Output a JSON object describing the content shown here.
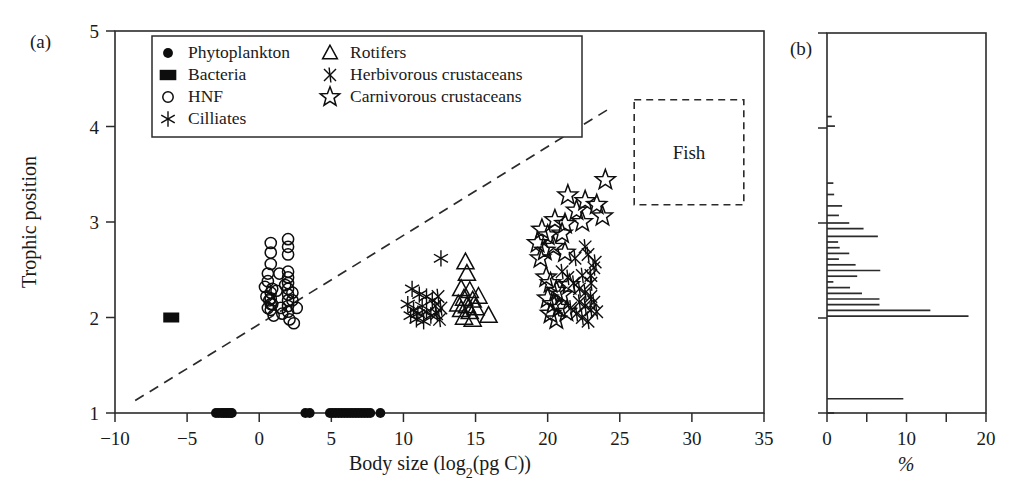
{
  "figure": {
    "panels": [
      {
        "id": "a",
        "label": "(a)"
      },
      {
        "id": "b",
        "label": "(b)"
      }
    ]
  },
  "legend": {
    "entries": [
      {
        "label": "Phytoplankton",
        "marker": "filled-circle-icon",
        "column": 0
      },
      {
        "label": "Bacteria",
        "marker": "filled-square-icon",
        "column": 0
      },
      {
        "label": "HNF",
        "marker": "open-circle-icon",
        "column": 0
      },
      {
        "label": "Cilliates",
        "marker": "asterisk-icon",
        "column": 0
      },
      {
        "label": "Rotifers",
        "marker": "open-triangle-icon",
        "column": 1
      },
      {
        "label": "Herbivorous crustaceans",
        "marker": "cross-x-icon",
        "column": 1
      },
      {
        "label": "Carnivorous crustaceans",
        "marker": "open-star-icon",
        "column": 1
      }
    ]
  },
  "annotations": {
    "fish_box_label": "Fish"
  },
  "chart_data": [
    {
      "panel": "a",
      "type": "scatter",
      "title": "",
      "xlabel": "Body size (log₂(pg C))",
      "ylabel": "Trophic position",
      "xlim": [
        -10,
        35
      ],
      "ylim": [
        1,
        5
      ],
      "xticks": [
        -10,
        -5,
        0,
        5,
        10,
        15,
        20,
        25,
        30,
        35
      ],
      "xticklabels": [
        "−10",
        "−5",
        "0",
        "5",
        "10",
        "15",
        "20",
        "25",
        "30",
        "35"
      ],
      "yticks": [
        1,
        2,
        3,
        4,
        5
      ],
      "yticklabels": [
        "1",
        "2",
        "3",
        "4",
        "5"
      ],
      "grid": false,
      "legend_position": "top-left-inside",
      "trendline": {
        "x": [
          -8.6,
          24.2
        ],
        "y": [
          1.13,
          4.18
        ],
        "style": "dashed"
      },
      "fish_box": {
        "x0": 26.0,
        "x1": 33.6,
        "y0": 3.18,
        "y1": 4.28,
        "label": "Fish"
      },
      "series": [
        {
          "name": "Phytoplankton",
          "marker": "filled-circle",
          "points": [
            [
              -3.0,
              1.0
            ],
            [
              -2.8,
              1.0
            ],
            [
              -2.6,
              1.0
            ],
            [
              -2.45,
              1.0
            ],
            [
              -2.3,
              1.0
            ],
            [
              -2.15,
              1.0
            ],
            [
              -2.0,
              1.0
            ],
            [
              -1.9,
              1.0
            ],
            [
              3.2,
              1.0
            ],
            [
              3.5,
              1.0
            ],
            [
              4.9,
              1.0
            ],
            [
              5.1,
              1.0
            ],
            [
              5.3,
              1.0
            ],
            [
              5.5,
              1.0
            ],
            [
              5.7,
              1.0
            ],
            [
              5.9,
              1.0
            ],
            [
              6.1,
              1.0
            ],
            [
              6.3,
              1.0
            ],
            [
              6.5,
              1.0
            ],
            [
              6.7,
              1.0
            ],
            [
              6.9,
              1.0
            ],
            [
              7.1,
              1.0
            ],
            [
              7.3,
              1.0
            ],
            [
              7.5,
              1.0
            ],
            [
              7.7,
              1.0
            ],
            [
              8.4,
              1.0
            ]
          ]
        },
        {
          "name": "Bacteria",
          "marker": "filled-square",
          "points": [
            [
              -6.1,
              2.0
            ]
          ]
        },
        {
          "name": "HNF",
          "marker": "open-circle",
          "points": [
            [
              0.8,
              2.78
            ],
            [
              0.8,
              2.68
            ],
            [
              0.8,
              2.56
            ],
            [
              2.0,
              2.82
            ],
            [
              2.0,
              2.74
            ],
            [
              2.0,
              2.66
            ],
            [
              0.6,
              2.46
            ],
            [
              0.6,
              2.38
            ],
            [
              0.4,
              2.32
            ],
            [
              0.9,
              2.3
            ],
            [
              2.0,
              2.48
            ],
            [
              2.0,
              2.42
            ],
            [
              2.0,
              2.36
            ],
            [
              2.0,
              2.3
            ],
            [
              1.2,
              2.28
            ],
            [
              0.5,
              2.22
            ],
            [
              0.7,
              2.18
            ],
            [
              0.9,
              2.14
            ],
            [
              0.8,
              2.26
            ],
            [
              0.8,
              2.2
            ],
            [
              0.8,
              2.14
            ],
            [
              0.8,
              2.08
            ],
            [
              2.0,
              2.24
            ],
            [
              2.0,
              2.18
            ],
            [
              2.0,
              2.12
            ],
            [
              2.0,
              2.06
            ],
            [
              2.3,
              2.26
            ],
            [
              2.3,
              2.18
            ],
            [
              1.5,
              2.1
            ],
            [
              1.6,
              2.04
            ],
            [
              1.0,
              2.02
            ],
            [
              2.1,
              1.98
            ],
            [
              2.6,
              2.1
            ],
            [
              2.4,
              1.94
            ],
            [
              0.6,
              2.1
            ],
            [
              1.8,
              2.34
            ],
            [
              1.4,
              2.46
            ]
          ]
        },
        {
          "name": "Cilliates",
          "marker": "asterisk",
          "points": [
            [
              12.6,
              2.62
            ],
            [
              10.6,
              2.3
            ],
            [
              11.6,
              2.22
            ],
            [
              10.3,
              2.14
            ],
            [
              10.7,
              2.08
            ],
            [
              11.0,
              2.04
            ],
            [
              11.3,
              2.12
            ],
            [
              11.6,
              2.06
            ],
            [
              11.9,
              2.02
            ],
            [
              10.9,
              1.98
            ],
            [
              11.4,
              1.96
            ],
            [
              10.5,
              2.02
            ],
            [
              12.0,
              2.18
            ],
            [
              11.1,
              2.24
            ]
          ]
        },
        {
          "name": "Rotifers",
          "marker": "open-triangle",
          "points": [
            [
              14.3,
              2.58
            ],
            [
              14.4,
              2.46
            ],
            [
              15.9,
              2.02
            ],
            [
              14.0,
              2.3
            ],
            [
              14.6,
              2.28
            ],
            [
              14.2,
              2.2
            ],
            [
              14.8,
              2.18
            ],
            [
              14.4,
              2.12
            ],
            [
              14.0,
              2.08
            ],
            [
              14.6,
              2.06
            ],
            [
              15.0,
              2.1
            ],
            [
              14.2,
              2.0
            ],
            [
              14.8,
              1.98
            ],
            [
              13.8,
              2.14
            ],
            [
              15.2,
              2.22
            ]
          ]
        },
        {
          "name": "Herbivorous crustaceans",
          "marker": "cross-x",
          "points": [
            [
              12.4,
              2.22
            ],
            [
              12.2,
              2.12
            ],
            [
              12.6,
              2.1
            ],
            [
              12.3,
              2.04
            ],
            [
              12.5,
              1.98
            ],
            [
              21.0,
              2.48
            ],
            [
              21.4,
              2.42
            ],
            [
              21.8,
              2.36
            ],
            [
              22.2,
              2.3
            ],
            [
              22.6,
              2.26
            ],
            [
              23.0,
              2.22
            ],
            [
              22.2,
              2.16
            ],
            [
              22.6,
              2.12
            ],
            [
              23.0,
              2.08
            ],
            [
              21.6,
              2.1
            ],
            [
              22.0,
              2.04
            ],
            [
              22.4,
              2.0
            ],
            [
              23.2,
              2.16
            ],
            [
              23.4,
              2.06
            ],
            [
              22.8,
              1.96
            ],
            [
              23.0,
              2.36
            ],
            [
              22.4,
              2.44
            ],
            [
              23.3,
              2.58
            ],
            [
              22.8,
              2.66
            ],
            [
              23.2,
              2.52
            ],
            [
              21.9,
              2.62
            ],
            [
              22.6,
              2.74
            ],
            [
              23.0,
              2.44
            ]
          ]
        },
        {
          "name": "Carnivorous crustaceans",
          "marker": "open-star",
          "points": [
            [
              24.0,
              3.44
            ],
            [
              21.4,
              3.28
            ],
            [
              22.6,
              3.22
            ],
            [
              23.4,
              3.18
            ],
            [
              22.0,
              3.12
            ],
            [
              23.8,
              3.06
            ],
            [
              20.5,
              3.02
            ],
            [
              21.2,
              2.98
            ],
            [
              22.4,
              3.0
            ],
            [
              19.6,
              2.92
            ],
            [
              20.0,
              2.86
            ],
            [
              21.0,
              2.88
            ],
            [
              19.3,
              2.78
            ],
            [
              20.4,
              2.74
            ],
            [
              19.8,
              2.7
            ],
            [
              21.2,
              2.68
            ],
            [
              19.5,
              2.62
            ],
            [
              20.2,
              2.36
            ],
            [
              20.6,
              2.28
            ],
            [
              21.0,
              2.24
            ],
            [
              20.0,
              2.2
            ],
            [
              20.4,
              2.14
            ],
            [
              20.8,
              2.1
            ],
            [
              20.2,
              2.04
            ],
            [
              20.6,
              1.98
            ],
            [
              21.3,
              2.06
            ],
            [
              19.9,
              2.42
            ],
            [
              21.5,
              2.34
            ]
          ]
        }
      ]
    },
    {
      "panel": "b",
      "type": "bar",
      "orientation": "horizontal",
      "title": "",
      "xlabel": "%",
      "ylabel": "",
      "xlim": [
        0,
        20
      ],
      "ylim": [
        1,
        5
      ],
      "xticks": [
        0,
        5,
        10,
        15,
        20
      ],
      "xticklabels": [
        "0",
        "",
        "10",
        "",
        "20"
      ],
      "yticks": [
        1,
        2,
        3,
        4,
        5
      ],
      "grid": false,
      "categories": [
        1.0,
        1.15,
        2.02,
        2.08,
        2.14,
        2.2,
        2.26,
        2.32,
        2.38,
        2.44,
        2.5,
        2.56,
        2.62,
        2.68,
        2.74,
        2.8,
        2.86,
        2.94,
        3.0,
        3.08,
        3.18,
        3.3,
        3.42,
        4.02,
        4.12
      ],
      "values": [
        0.9,
        9.6,
        17.8,
        13.0,
        6.6,
        6.6,
        4.4,
        2.9,
        0.8,
        3.8,
        6.7,
        3.6,
        1.5,
        2.8,
        1.6,
        1.4,
        6.4,
        4.6,
        2.8,
        1.5,
        1.9,
        0.9,
        0.8,
        1.0,
        0.6
      ]
    }
  ]
}
